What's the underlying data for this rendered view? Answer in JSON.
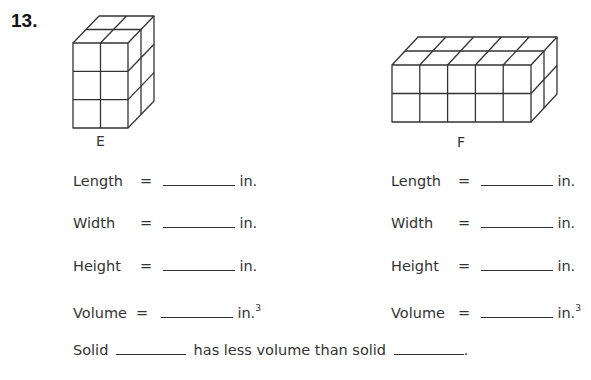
{
  "problem_number": "13.",
  "solids": [
    {
      "label": "E",
      "cubes": {
        "columns": 2,
        "rows": 3,
        "depth": 2
      },
      "rows": [
        {
          "label": "Length",
          "eq": "=",
          "unit": "in.",
          "sup": ""
        },
        {
          "label": "Width",
          "eq": "=",
          "unit": "in.",
          "sup": ""
        },
        {
          "label": "Height",
          "eq": "=",
          "unit": "in.",
          "sup": ""
        },
        {
          "label": "Volume",
          "eq": "=",
          "unit": "in.",
          "sup": "3"
        }
      ]
    },
    {
      "label": "F",
      "cubes": {
        "columns": 5,
        "rows": 2,
        "depth": 2
      },
      "rows": [
        {
          "label": "Length",
          "eq": "=",
          "unit": "in.",
          "sup": ""
        },
        {
          "label": "Width",
          "eq": "=",
          "unit": "in.",
          "sup": ""
        },
        {
          "label": "Height",
          "eq": "=",
          "unit": "in.",
          "sup": ""
        },
        {
          "label": "Volume",
          "eq": "=",
          "unit": "in.",
          "sup": "3"
        }
      ]
    }
  ],
  "comparison": {
    "part1": "Solid",
    "part2": "has less volume than solid",
    "part3": "."
  }
}
